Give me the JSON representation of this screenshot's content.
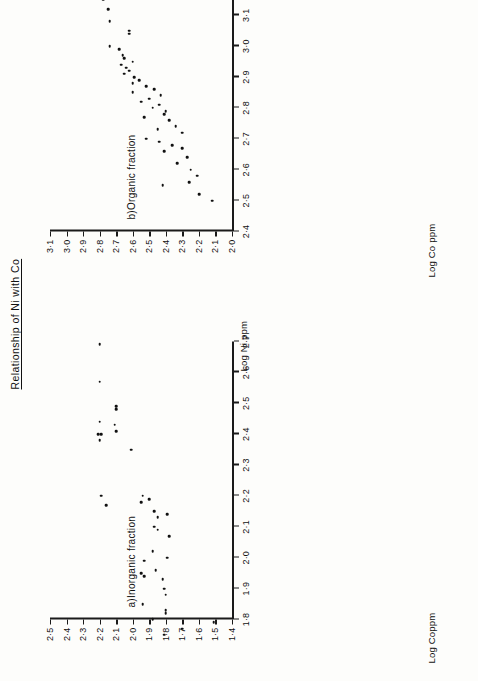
{
  "figure": {
    "title": "Relationship of Ni with Co",
    "background_color": "#fdfdfb",
    "ink_color": "#111111",
    "orientation": "landscape-rotated-90deg"
  },
  "chart_data": [
    {
      "type": "scatter",
      "id": "panel-a",
      "title": "a)Inorganic fraction",
      "xlabel": "Log Ni ppm",
      "ylabel": "Log Coppm",
      "xlim": [
        1.8,
        2.7
      ],
      "ylim": [
        1.4,
        2.5
      ],
      "grid": false,
      "legend": "none",
      "xticks": [
        "1·8",
        "1·9",
        "2·0",
        "2·1",
        "2·2",
        "2·3",
        "2·4",
        "2·5",
        "2·6",
        "2·7"
      ],
      "xtick_values": [
        1.8,
        1.9,
        2.0,
        2.1,
        2.2,
        2.3,
        2.4,
        2.5,
        2.6,
        2.7
      ],
      "yticks": [
        "1·4",
        "1·5",
        "1·6",
        "1·7",
        "1·8",
        "1·9",
        "2·0",
        "2·1",
        "2·2",
        "2·3",
        "2·4",
        "2·5"
      ],
      "ytick_values": [
        1.4,
        1.5,
        1.6,
        1.7,
        1.8,
        1.9,
        2.0,
        2.1,
        2.2,
        2.3,
        2.4,
        2.5
      ],
      "points": [
        [
          2.69,
          2.2
        ],
        [
          2.57,
          2.2
        ],
        [
          2.49,
          2.1
        ],
        [
          2.48,
          2.1
        ],
        [
          2.44,
          2.2
        ],
        [
          2.43,
          2.11
        ],
        [
          2.41,
          2.1
        ],
        [
          2.4,
          2.21
        ],
        [
          2.4,
          2.19
        ],
        [
          2.38,
          2.2
        ],
        [
          2.35,
          2.01
        ],
        [
          2.2,
          2.19
        ],
        [
          2.2,
          1.94
        ],
        [
          2.19,
          1.9
        ],
        [
          2.18,
          1.95
        ],
        [
          2.17,
          2.16
        ],
        [
          2.15,
          1.87
        ],
        [
          2.14,
          1.79
        ],
        [
          2.13,
          1.85
        ],
        [
          2.1,
          1.87
        ],
        [
          2.09,
          1.85
        ],
        [
          2.07,
          1.78
        ],
        [
          2.02,
          1.88
        ],
        [
          2.0,
          1.79
        ],
        [
          1.99,
          1.93
        ],
        [
          1.96,
          1.86
        ],
        [
          1.95,
          1.95
        ],
        [
          1.94,
          1.93
        ],
        [
          1.93,
          1.82
        ],
        [
          1.9,
          1.81
        ],
        [
          1.88,
          1.8
        ],
        [
          1.85,
          1.94
        ],
        [
          1.83,
          1.8
        ],
        [
          1.82,
          1.8
        ],
        [
          1.8,
          1.88
        ],
        [
          1.79,
          1.51
        ],
        [
          1.77,
          1.7
        ],
        [
          1.75,
          1.81
        ],
        [
          1.56,
          1.8
        ],
        [
          1.52,
          1.61
        ]
      ]
    },
    {
      "type": "scatter",
      "id": "panel-b",
      "title": "b)Organic  fraction",
      "xlabel": "Log Ni ppm",
      "ylabel": "Log Co ppm",
      "xlim": [
        2.4,
        3.3
      ],
      "ylim": [
        2.0,
        3.1
      ],
      "grid": false,
      "legend": "none",
      "xticks": [
        "2·4",
        "2·5",
        "2·6",
        "2·7",
        "2·8",
        "2·9",
        "3·0",
        "3·1",
        "3·2",
        "3·3"
      ],
      "xtick_values": [
        2.4,
        2.5,
        2.6,
        2.7,
        2.8,
        2.9,
        3.0,
        3.1,
        3.2,
        3.3
      ],
      "yticks": [
        "2·0",
        "2·1",
        "2·2",
        "2·3",
        "2·4",
        "2·5",
        "2·6",
        "2·7",
        "2·8",
        "2·9",
        "3·0",
        "3·1"
      ],
      "ytick_values": [
        2.0,
        2.1,
        2.2,
        2.3,
        2.4,
        2.5,
        2.6,
        2.7,
        2.8,
        2.9,
        3.0,
        3.1
      ],
      "points": [
        [
          3.3,
          3.09
        ],
        [
          3.18,
          3.03
        ],
        [
          3.2,
          2.8
        ],
        [
          3.19,
          2.8
        ],
        [
          3.16,
          2.78
        ],
        [
          3.15,
          2.78
        ],
        [
          3.12,
          2.75
        ],
        [
          3.08,
          2.74
        ],
        [
          3.05,
          2.62
        ],
        [
          3.04,
          2.62
        ],
        [
          3.0,
          2.74
        ],
        [
          2.99,
          2.68
        ],
        [
          2.97,
          2.66
        ],
        [
          2.96,
          2.65
        ],
        [
          2.95,
          2.6
        ],
        [
          2.94,
          2.67
        ],
        [
          2.93,
          2.64
        ],
        [
          2.92,
          2.62
        ],
        [
          2.91,
          2.65
        ],
        [
          2.9,
          2.59
        ],
        [
          2.89,
          2.56
        ],
        [
          2.88,
          2.6
        ],
        [
          2.87,
          2.52
        ],
        [
          2.86,
          2.47
        ],
        [
          2.85,
          2.6
        ],
        [
          2.84,
          2.43
        ],
        [
          2.83,
          2.5
        ],
        [
          2.82,
          2.55
        ],
        [
          2.81,
          2.44
        ],
        [
          2.8,
          2.48
        ],
        [
          2.79,
          2.4
        ],
        [
          2.78,
          2.41
        ],
        [
          2.77,
          2.53
        ],
        [
          2.76,
          2.38
        ],
        [
          2.74,
          2.34
        ],
        [
          2.73,
          2.45
        ],
        [
          2.72,
          2.3
        ],
        [
          2.7,
          2.52
        ],
        [
          2.69,
          2.44
        ],
        [
          2.68,
          2.36
        ],
        [
          2.67,
          2.3
        ],
        [
          2.66,
          2.41
        ],
        [
          2.64,
          2.27
        ],
        [
          2.62,
          2.33
        ],
        [
          2.6,
          2.25
        ],
        [
          2.58,
          2.21
        ],
        [
          2.56,
          2.26
        ],
        [
          2.55,
          2.42
        ],
        [
          2.52,
          2.2
        ],
        [
          2.5,
          2.12
        ]
      ]
    }
  ]
}
